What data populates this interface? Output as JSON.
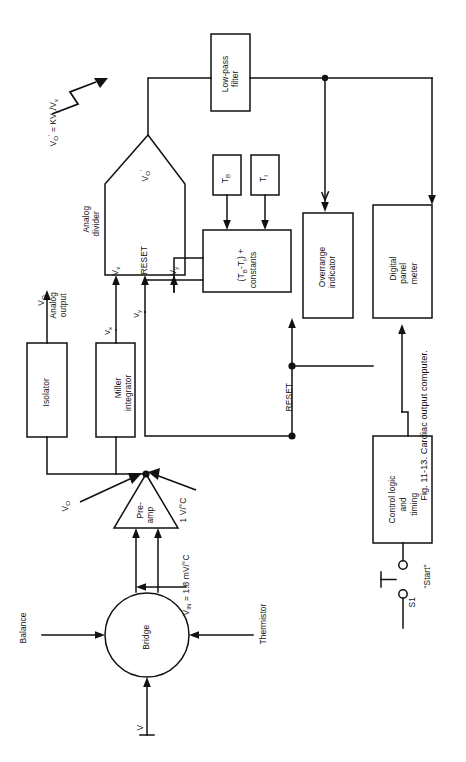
{
  "figure": {
    "caption": "Fig. 11-13. Cardiac output computer.",
    "number": "11-13",
    "title": "Cardiac output computer"
  },
  "blocks": {
    "low_pass_filter": "Low-pass\nfilter",
    "analog_divider": "Analog\ndivider",
    "isolator": "Isolator",
    "miller_integrator": "Miller\nintegrator",
    "tb_box": "T",
    "tb_sub": "B",
    "ti_box": "T",
    "ti_sub": "I",
    "constants_box": "(T",
    "constants_sub1": "B",
    "constants_mid": "-T",
    "constants_sub2": "I",
    "constants_tail": ") +\nconstants",
    "overrange_indicator": "Overrange\nindicator",
    "digital_panel_meter": "Digital\npanel\nmeter",
    "control_logic": "Control logic\nand\ntiming",
    "preamp": "Pre-\namp",
    "bridge": "Bridge"
  },
  "ports": {
    "vx": "V",
    "vx_sub": "x",
    "vy": "V",
    "vy_sub": "y",
    "reset_port": "RESET",
    "vo_prime_out": "V",
    "vo_prime_out_sub": "O",
    "vo_prime_out_sup": "'"
  },
  "annotations": {
    "divider_eq": "V",
    "divider_eq_sub": "O",
    "divider_eq_sup": "'",
    "divider_eq_rest": " = KV",
    "divider_eq_sub2": "y",
    "divider_eq_slash": "/V",
    "divider_eq_sub3": "x",
    "vo_analog_output": "V",
    "vo_analog_output_sub": "O",
    "vo_analog_output_rest": "\nAnalog\noutput",
    "wire_vx": "V",
    "wire_vx_sub": "x",
    "wire_vy": "V",
    "wire_vy_sub": "y",
    "reset_line": "RESET",
    "vo_node": "V",
    "vo_node_sub": "O",
    "one_volt_per_c": "1 V/°C",
    "vin_sensitivity": "V",
    "vin_sensitivity_sub": "IN",
    "vin_sensitivity_rest": " = 1.8 mV/°C",
    "balance": "Balance",
    "thermistor": "Thermistor",
    "supply_v": "V",
    "switch_name": "S1",
    "switch_label": "“Start”"
  },
  "colors": {
    "line": "#111111",
    "background": "#ffffff",
    "text": "#111111"
  }
}
